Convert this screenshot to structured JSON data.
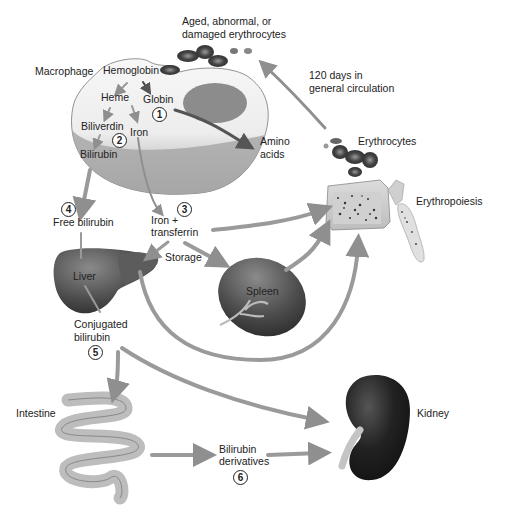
{
  "diagram": {
    "labels": {
      "aged": "Aged, abnormal, or\ndamaged erythrocytes",
      "aged_line1": "Aged, abnormal, or",
      "aged_line2": "damaged erythrocytes",
      "macrophage": "Macrophage",
      "hemoglobin": "Hemoglobin",
      "heme": "Heme",
      "globin": "Globin",
      "biliverdin": "Biliverdin",
      "iron": "Iron",
      "bilirubin": "Bilirubin",
      "amino_line1": "Amino",
      "amino_line2": "acids",
      "circulation_line1": "120 days in",
      "circulation_line2": "general circulation",
      "erythrocytes": "Erythrocytes",
      "erythropoiesis": "Erythropoiesis",
      "free_bilirubin": "Free bilirubin",
      "iron_transferrin_line1": "Iron +",
      "iron_transferrin_line2": "transferrin",
      "storage": "Storage",
      "liver": "Liver",
      "spleen": "Spleen",
      "conjugated_line1": "Conjugated",
      "conjugated_line2": "bilirubin",
      "intestine": "Intestine",
      "kidney": "Kidney",
      "derivatives_line1": "Bilirubin",
      "derivatives_line2": "derivatives"
    },
    "steps": [
      "1",
      "2",
      "3",
      "4",
      "5",
      "6"
    ],
    "nodes": [
      {
        "id": "aged-erythrocytes",
        "label": "Aged, abnormal, or damaged erythrocytes"
      },
      {
        "id": "macrophage",
        "label": "Macrophage"
      },
      {
        "id": "amino-acids",
        "label": "Amino acids"
      },
      {
        "id": "erythrocytes",
        "label": "Erythrocytes"
      },
      {
        "id": "erythropoiesis",
        "label": "Erythropoiesis"
      },
      {
        "id": "free-bilirubin",
        "label": "Free bilirubin"
      },
      {
        "id": "iron-transferrin",
        "label": "Iron + transferrin"
      },
      {
        "id": "liver",
        "label": "Liver"
      },
      {
        "id": "spleen",
        "label": "Spleen"
      },
      {
        "id": "conjugated-bilirubin",
        "label": "Conjugated bilirubin"
      },
      {
        "id": "intestine",
        "label": "Intestine"
      },
      {
        "id": "bilirubin-derivatives",
        "label": "Bilirubin derivatives"
      },
      {
        "id": "kidney",
        "label": "Kidney"
      }
    ],
    "edges": [
      {
        "from": "Hemoglobin",
        "to": "Heme"
      },
      {
        "from": "Hemoglobin",
        "to": "Globin"
      },
      {
        "from": "Heme",
        "to": "Biliverdin"
      },
      {
        "from": "Heme",
        "to": "Iron"
      },
      {
        "from": "Biliverdin",
        "to": "Bilirubin"
      },
      {
        "from": "Globin",
        "to": "Amino acids",
        "step": "1"
      },
      {
        "from": "Bilirubin",
        "to": "Free bilirubin",
        "step": "4"
      },
      {
        "from": "Iron",
        "to": "Iron + transferrin",
        "step": "3"
      },
      {
        "from": "Iron + transferrin",
        "to": "Erythropoiesis"
      },
      {
        "from": "Iron + transferrin",
        "to": "Liver",
        "label": "Storage"
      },
      {
        "from": "Iron + transferrin",
        "to": "Spleen",
        "label": "Storage"
      },
      {
        "from": "Spleen",
        "to": "Erythropoiesis"
      },
      {
        "from": "Liver",
        "to": "Erythropoiesis"
      },
      {
        "from": "Free bilirubin",
        "to": "Liver"
      },
      {
        "from": "Liver",
        "to": "Conjugated bilirubin",
        "step": "5"
      },
      {
        "from": "Conjugated bilirubin",
        "to": "Intestine"
      },
      {
        "from": "Conjugated bilirubin",
        "to": "Kidney"
      },
      {
        "from": "Intestine",
        "to": "Bilirubin derivatives",
        "step": "6"
      },
      {
        "from": "Bilirubin derivatives",
        "to": "Kidney"
      },
      {
        "from": "Erythrocytes",
        "to": "Aged, abnormal, or damaged erythrocytes",
        "label": "120 days in general circulation"
      },
      {
        "from": "Erythropoiesis",
        "to": "Erythrocytes"
      }
    ]
  }
}
